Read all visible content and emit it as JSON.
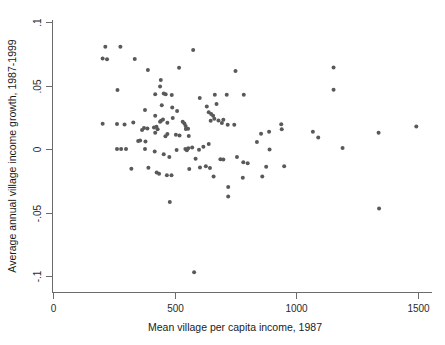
{
  "chart_data": {
    "type": "scatter",
    "title": "",
    "xlabel": "Mean village per capita income, 1987",
    "ylabel": "Average annual village income growth, 1987-1999",
    "xlim": [
      0,
      1540
    ],
    "ylim": [
      -0.102,
      0.1
    ],
    "xticks": [
      0,
      500,
      1000,
      1500
    ],
    "xtick_labels": [
      "0",
      "500",
      "1000",
      "1500"
    ],
    "yticks": [
      0.1,
      0.05,
      0,
      -0.05,
      -0.1
    ],
    "ytick_labels": [
      ".1",
      ".05",
      "0",
      "-.05",
      "-.1"
    ],
    "grid": false,
    "legend": null,
    "marker_color": "#595959",
    "marker_size": 4,
    "n_points": 120,
    "points": [
      [
        215,
        0.0805
      ],
      [
        277,
        0.0805
      ],
      [
        204,
        0.0713
      ],
      [
        222,
        0.0707
      ],
      [
        336,
        0.0708
      ],
      [
        390,
        0.0622
      ],
      [
        443,
        0.0543
      ],
      [
        265,
        0.0465
      ],
      [
        518,
        0.0639
      ],
      [
        576,
        0.078
      ],
      [
        750,
        0.0614
      ],
      [
        1153,
        0.0641
      ],
      [
        1153,
        0.0466
      ],
      [
        263,
        0.0196
      ],
      [
        330,
        0.0209
      ],
      [
        440,
        0.0492
      ],
      [
        420,
        0.0432
      ],
      [
        455,
        0.0437
      ],
      [
        463,
        0.0432
      ],
      [
        488,
        0.0425
      ],
      [
        603,
        0.0402
      ],
      [
        665,
        0.0427
      ],
      [
        714,
        0.0427
      ],
      [
        784,
        0.0427
      ],
      [
        378,
        0.0308
      ],
      [
        420,
        0.0262
      ],
      [
        447,
        0.0345
      ],
      [
        490,
        0.0327
      ],
      [
        510,
        0.03
      ],
      [
        632,
        0.0335
      ],
      [
        672,
        0.0355
      ],
      [
        640,
        0.029
      ],
      [
        650,
        0.0276
      ],
      [
        658,
        0.0262
      ],
      [
        663,
        0.0239
      ],
      [
        680,
        0.0225
      ],
      [
        700,
        0.023
      ],
      [
        374,
        0.0165
      ],
      [
        388,
        0.0162
      ],
      [
        440,
        0.0214
      ],
      [
        444,
        0.0222
      ],
      [
        452,
        0.0232
      ],
      [
        470,
        0.0207
      ],
      [
        492,
        0.0245
      ],
      [
        533,
        0.0214
      ],
      [
        540,
        0.02
      ],
      [
        545,
        0.0182
      ],
      [
        745,
        0.019
      ],
      [
        938,
        0.0194
      ],
      [
        1493,
        0.0178
      ],
      [
        888,
        0.0135
      ],
      [
        940,
        0.0155
      ],
      [
        1068,
        0.0136
      ],
      [
        1338,
        0.0128
      ],
      [
        855,
        0.012
      ],
      [
        838,
        0.0056
      ],
      [
        1090,
        0.009
      ],
      [
        366,
        0.015
      ],
      [
        420,
        0.0128
      ],
      [
        470,
        0.0118
      ],
      [
        520,
        0.0107
      ],
      [
        558,
        0.0103
      ],
      [
        350,
        0.0063
      ],
      [
        378,
        0.0
      ],
      [
        263,
        0.0
      ],
      [
        280,
        0.0
      ],
      [
        300,
        0.0
      ],
      [
        508,
        -0.0008
      ],
      [
        544,
        0.0
      ],
      [
        550,
        -0.001
      ],
      [
        556,
        0.0005
      ],
      [
        600,
        -0.0006
      ],
      [
        640,
        0.004
      ],
      [
        1190,
        0.0008
      ],
      [
        890,
        -0.0004
      ],
      [
        455,
        -0.0042
      ],
      [
        478,
        -0.0063
      ],
      [
        586,
        -0.0076
      ],
      [
        688,
        -0.008
      ],
      [
        700,
        -0.0083
      ],
      [
        756,
        -0.0063
      ],
      [
        782,
        -0.0104
      ],
      [
        800,
        -0.0112
      ],
      [
        392,
        -0.0148
      ],
      [
        426,
        -0.0186
      ],
      [
        436,
        -0.0195
      ],
      [
        468,
        -0.0207
      ],
      [
        487,
        -0.0207
      ],
      [
        560,
        -0.0158
      ],
      [
        604,
        -0.0145
      ],
      [
        628,
        -0.0135
      ],
      [
        645,
        -0.015
      ],
      [
        876,
        -0.014
      ],
      [
        950,
        -0.0135
      ],
      [
        660,
        -0.0217
      ],
      [
        780,
        -0.0227
      ],
      [
        860,
        -0.0216
      ],
      [
        720,
        -0.03
      ],
      [
        480,
        -0.0418
      ],
      [
        720,
        -0.0374
      ],
      [
        1340,
        -0.0468
      ],
      [
        580,
        -0.097
      ],
      [
        204,
        0.0198
      ],
      [
        294,
        0.0192
      ],
      [
        380,
        0.0059
      ],
      [
        430,
        0.0155
      ],
      [
        358,
        0.0066
      ],
      [
        415,
        0.017
      ],
      [
        425,
        0.0175
      ],
      [
        505,
        0.0112
      ],
      [
        546,
        0.0158
      ],
      [
        555,
        0.016
      ],
      [
        572,
        0.0012
      ],
      [
        618,
        0.0018
      ],
      [
        648,
        0.0222
      ],
      [
        694,
        0.0205
      ],
      [
        718,
        0.019
      ],
      [
        322,
        -0.0155
      ],
      [
        418,
        -0.002
      ],
      [
        462,
        0.01
      ]
    ]
  },
  "axes": {
    "x_tick_labels": [
      "0",
      "500",
      "1000",
      "1500"
    ],
    "y_tick_labels": [
      ".1",
      ".05",
      "0",
      "-.05",
      "-.1"
    ],
    "x_axis_title": "Mean village per capita income, 1987",
    "y_axis_title": "Average annual village income growth, 1987-1999"
  }
}
